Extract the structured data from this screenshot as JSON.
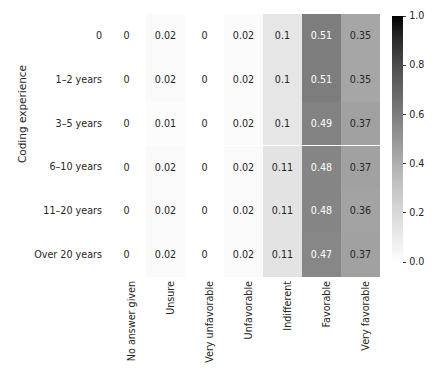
{
  "chart_data": {
    "type": "heatmap",
    "title": "",
    "xlabel": "",
    "ylabel": "Coding experience",
    "categories_x": [
      "No answer given",
      "Unsure",
      "Very unfavorable",
      "Unfavorable",
      "Indifferent",
      "Favorable",
      "Very favorable"
    ],
    "categories_y": [
      "0",
      "1–2 years",
      "3–5 years",
      "6–10 years",
      "11–20 years",
      "Over 20 years"
    ],
    "values": [
      [
        0,
        0.02,
        0,
        0.02,
        0.1,
        0.51,
        0.35
      ],
      [
        0,
        0.02,
        0,
        0.02,
        0.1,
        0.51,
        0.35
      ],
      [
        0,
        0.01,
        0,
        0.02,
        0.1,
        0.49,
        0.37
      ],
      [
        0,
        0.02,
        0,
        0.02,
        0.11,
        0.48,
        0.37
      ],
      [
        0,
        0.02,
        0,
        0.02,
        0.11,
        0.48,
        0.36
      ],
      [
        0,
        0.02,
        0,
        0.02,
        0.11,
        0.47,
        0.37
      ]
    ],
    "cell_text": [
      [
        "0",
        "0.02",
        "0",
        "0.02",
        "0.1",
        "0.51",
        "0.35"
      ],
      [
        "0",
        "0.02",
        "0",
        "0.02",
        "0.1",
        "0.51",
        "0.35"
      ],
      [
        "0",
        "0.01",
        "0",
        "0.02",
        "0.1",
        "0.49",
        "0.37"
      ],
      [
        "0",
        "0.02",
        "0",
        "0.02",
        "0.11",
        "0.48",
        "0.37"
      ],
      [
        "0",
        "0.02",
        "0",
        "0.02",
        "0.11",
        "0.48",
        "0.36"
      ],
      [
        "0",
        "0.02",
        "0",
        "0.02",
        "0.11",
        "0.47",
        "0.37"
      ]
    ],
    "colormap": "greys",
    "colorbar": {
      "position": "right",
      "orientation": "vertical",
      "vmin": 0.0,
      "vmax": 1.0,
      "ticks": [
        0.0,
        0.2,
        0.4,
        0.6,
        0.8,
        1.0
      ],
      "tick_labels": [
        "0.0",
        "0.2",
        "0.4",
        "0.6",
        "0.8",
        "1.0"
      ]
    },
    "grid": false,
    "annotate": true
  },
  "style": {
    "text_color": "#262626",
    "cell_text_light": "#ffffff",
    "cell_text_dark": "#262626",
    "background": "#ffffff",
    "cmap_low": "#ffffff",
    "cmap_high": "#000000"
  }
}
